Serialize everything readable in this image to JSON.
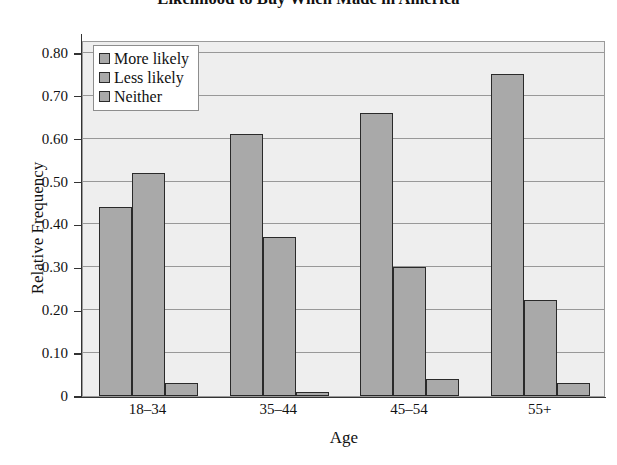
{
  "chart_data": {
    "type": "bar",
    "title": "Likelihood to Buy When Made in America",
    "xlabel": "Age",
    "ylabel": "Relative Frequency",
    "categories": [
      "18–34",
      "35–44",
      "45–54",
      "55+"
    ],
    "series": [
      {
        "name": "More likely",
        "values": [
          0.44,
          0.61,
          0.66,
          0.75
        ],
        "color": "#a9a9a9"
      },
      {
        "name": "Less likely",
        "values": [
          0.52,
          0.37,
          0.3,
          0.225
        ],
        "color": "#a9a9a9"
      },
      {
        "name": "Neither",
        "values": [
          0.03,
          0.01,
          0.04,
          0.03
        ],
        "color": "#a9a9a9"
      }
    ],
    "ylim": [
      0,
      0.83
    ],
    "yticks": [
      0,
      0.1,
      0.2,
      0.3,
      0.4,
      0.5,
      0.6,
      0.7,
      0.8
    ],
    "ytick_labels": [
      "0",
      "0.10",
      "0.20",
      "0.30",
      "0.40",
      "0.50",
      "0.60",
      "0.70",
      "0.80"
    ],
    "grid": true,
    "legend_position": "top-left",
    "plot_background": "#eeeeee",
    "gridline_color": "#989898",
    "bar_edge_color": "#2a2a2a"
  }
}
